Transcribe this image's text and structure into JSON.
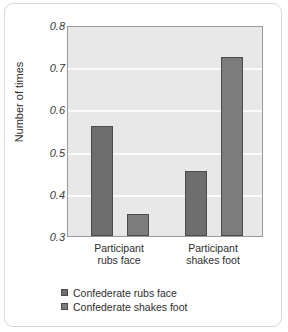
{
  "chart_data": {
    "type": "bar",
    "title": "",
    "xlabel": "",
    "ylabel": "Number of times",
    "ylim": [
      0.3,
      0.8
    ],
    "yticks": [
      0.8,
      0.7,
      0.6,
      0.5,
      0.4,
      0.3
    ],
    "ytick_labels": [
      "0.8",
      "0.7",
      "0.6",
      "0.5",
      "0.4",
      "0.3"
    ],
    "grid": true,
    "legend_position": "below-axes-left",
    "categories": [
      "Participant rubs face",
      "Participant shakes foot"
    ],
    "category_lines": [
      {
        "line1": "Participant",
        "line2": "rubs face"
      },
      {
        "line1": "Participant",
        "line2": "shakes foot"
      }
    ],
    "series": [
      {
        "name": "Confederate rubs face",
        "color": "#6e6e6e",
        "values": [
          0.56,
          0.455
        ]
      },
      {
        "name": "Confederate shakes foot",
        "color": "#7c7c7c",
        "values": [
          0.353,
          0.725
        ]
      }
    ]
  },
  "figure": {
    "background_color": "#ffffff",
    "plot_background_color": "#e8e8e8",
    "gridline_color": "#fbfbfb",
    "axis_color": "#9a9a9a"
  }
}
